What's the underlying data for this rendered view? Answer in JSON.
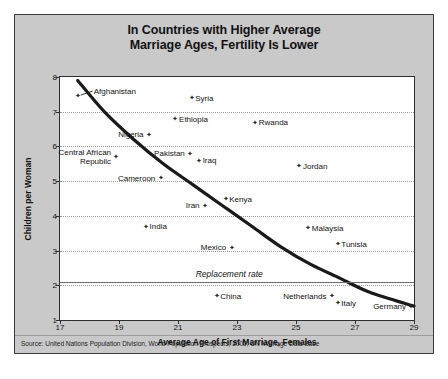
{
  "title": {
    "line1": "In Countries with Higher Average",
    "line2": "Marriage Ages, Fertility Is Lower"
  },
  "source": "Source: United Nations Population Division, World Population Prospects, 2002; UN Marriage Data Base",
  "chart_data": {
    "type": "scatter",
    "title": "In Countries with Higher Average Marriage Ages, Fertility Is Lower",
    "xlabel": "Average Age of First Marriage, Females",
    "ylabel": "Children per Woman",
    "xlim": [
      17,
      29
    ],
    "ylim": [
      1,
      8
    ],
    "xticks": [
      17,
      19,
      21,
      23,
      25,
      27,
      29
    ],
    "yticks": [
      1,
      2,
      3,
      4,
      5,
      6,
      7,
      8
    ],
    "grid": "horizontal-dotted",
    "legend": "none",
    "annotations": [
      {
        "text": "Replacement rate",
        "y": 2.1,
        "type": "horizontal-line"
      }
    ],
    "trendline": {
      "type": "smooth-decreasing",
      "points": [
        [
          17.6,
          7.9
        ],
        [
          18.5,
          7.0
        ],
        [
          19.5,
          6.2
        ],
        [
          20.5,
          5.5
        ],
        [
          21.5,
          4.9
        ],
        [
          22.5,
          4.3
        ],
        [
          23.5,
          3.7
        ],
        [
          24.5,
          3.1
        ],
        [
          25.5,
          2.6
        ],
        [
          26.5,
          2.2
        ],
        [
          27.5,
          1.8
        ],
        [
          29.0,
          1.4
        ]
      ]
    },
    "points": [
      {
        "name": "Afghanistan",
        "x": 17.6,
        "y": 7.45,
        "label_side": "right",
        "leader": true
      },
      {
        "name": "Syria",
        "x": 21.45,
        "y": 7.4,
        "label_side": "right"
      },
      {
        "name": "Ethiopia",
        "x": 20.9,
        "y": 6.8,
        "label_side": "right"
      },
      {
        "name": "Rwanda",
        "x": 23.6,
        "y": 6.7,
        "label_side": "right"
      },
      {
        "name": "Nigeria",
        "x": 20.0,
        "y": 6.35,
        "label_side": "left"
      },
      {
        "name": "Central African Republic",
        "x": 18.9,
        "y": 5.7,
        "label_side": "left",
        "two_line": true
      },
      {
        "name": "Pakistan",
        "x": 21.4,
        "y": 5.8,
        "label_side": "left"
      },
      {
        "name": "Iraq",
        "x": 21.7,
        "y": 5.6,
        "label_side": "right"
      },
      {
        "name": "Jordan",
        "x": 25.1,
        "y": 5.45,
        "label_side": "right"
      },
      {
        "name": "Cameroon",
        "x": 20.4,
        "y": 5.1,
        "label_side": "left"
      },
      {
        "name": "Kenya",
        "x": 22.6,
        "y": 4.5,
        "label_side": "right"
      },
      {
        "name": "Iran",
        "x": 21.9,
        "y": 4.3,
        "label_side": "left"
      },
      {
        "name": "India",
        "x": 19.9,
        "y": 3.7,
        "label_side": "right"
      },
      {
        "name": "Malaysia",
        "x": 25.4,
        "y": 3.65,
        "label_side": "right"
      },
      {
        "name": "Mexico",
        "x": 22.8,
        "y": 3.1,
        "label_side": "left"
      },
      {
        "name": "Tunisia",
        "x": 26.4,
        "y": 3.2,
        "label_side": "right"
      },
      {
        "name": "China",
        "x": 22.3,
        "y": 1.7,
        "label_side": "right"
      },
      {
        "name": "Netherlands",
        "x": 26.2,
        "y": 1.7,
        "label_side": "left"
      },
      {
        "name": "Italy",
        "x": 26.4,
        "y": 1.5,
        "label_side": "right"
      },
      {
        "name": "Germany",
        "x": 28.9,
        "y": 1.4,
        "label_side": "left"
      }
    ]
  },
  "colors": {
    "panel": "#c9c9c9",
    "plot_background": "#ffffff",
    "axis": "#2e2e2e",
    "gridline": "#9a9a9a",
    "trendline": "#1a1a1a",
    "replacement_line": "#6d6d6d",
    "text": "#111111"
  }
}
